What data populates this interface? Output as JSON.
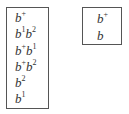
{
  "left_box": {
    "items": [
      {
        "base1": "b",
        "sup1": "+",
        "base2": "",
        "sup2": ""
      },
      {
        "base1": "b",
        "sup1": "1",
        "base2": "b",
        "sup2": "2"
      },
      {
        "base1": "b",
        "sup1": "+",
        "base2": "b",
        "sup2": "1"
      },
      {
        "base1": "b",
        "sup1": "+",
        "base2": "b",
        "sup2": "2"
      },
      {
        "base1": "b",
        "sup1": "2",
        "base2": "",
        "sup2": ""
      },
      {
        "base1": "b",
        "sup1": "1",
        "base2": "",
        "sup2": ""
      }
    ]
  },
  "right_box": {
    "items": [
      {
        "base1": "b",
        "sup1": "+"
      },
      {
        "base1": "b",
        "sup1": ""
      }
    ]
  }
}
